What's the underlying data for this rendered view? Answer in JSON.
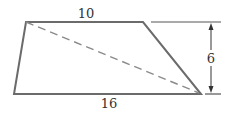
{
  "figure": {
    "type": "trapezoid",
    "labels": {
      "top_base": "10",
      "bottom_base": "16",
      "height": "6"
    },
    "diagonal": "dashed",
    "colors": {
      "outline": "#6b6b6b",
      "diagonal": "#8a8a8a",
      "text": "#333333"
    }
  }
}
